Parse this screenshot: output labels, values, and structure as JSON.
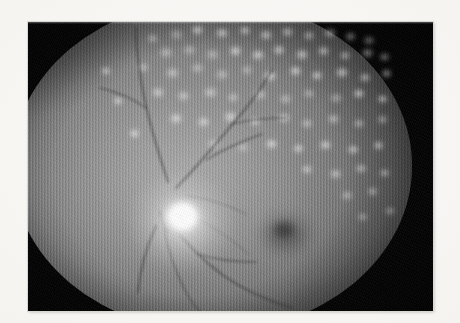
{
  "image": {
    "kind": "fundus-photograph",
    "modality": "Color fundus photography (reproduced grayscale)",
    "caption": "",
    "frame": {
      "background_color": "#050505",
      "page_color": "#f6f5f3"
    }
  },
  "figure": {
    "title": "",
    "label": "",
    "subtitle": ""
  },
  "anatomy": {
    "optic_disc": {
      "name": "optic disc",
      "center_x": 160,
      "center_y": 207,
      "brightness": "bright white"
    },
    "macula": {
      "name": "macula",
      "center_x": 257,
      "center_y": 212,
      "brightness": "dark"
    },
    "fovea": {
      "name": "fovea",
      "center_x": 256,
      "center_y": 208
    },
    "field_circle": {
      "name": "fundus field",
      "center_x": 184,
      "center_y": 144
    }
  },
  "findings": {
    "lesion_type": "panretinal laser photocoagulation scars",
    "lesion_color": "#ffffff",
    "distribution": "dense superiorly and temporally, sparse at macula"
  },
  "vessels": [
    {
      "id": "superotemporal-arcade",
      "d": "M176 188 C 196 168, 214 146, 236 120 C 250 104, 262 88, 272 70"
    },
    {
      "id": "superotemporal-branch-1",
      "d": "M206 160 C 222 150, 240 142, 262 134"
    },
    {
      "id": "superotemporal-branch-2",
      "d": "M232 124 C 248 120, 266 118, 286 118"
    },
    {
      "id": "superonasal-arcade",
      "d": "M168 182 C 158 152, 148 120, 142 86 C 138 62, 136 44, 136 28"
    },
    {
      "id": "superonasal-branch",
      "d": "M146 108 C 132 98, 118 92, 100 88"
    },
    {
      "id": "inferotemporal-arcade",
      "d": "M172 224 C 186 244, 202 260, 224 276 C 244 290, 266 300, 292 308"
    },
    {
      "id": "inferotemporal-branch-1",
      "d": "M164 228 C 168 252, 176 274, 188 296 C 194 306, 200 312, 206 318"
    },
    {
      "id": "inferotemporal-branch-2",
      "d": "M198 254 C 216 260, 234 262, 256 262"
    },
    {
      "id": "inferonasal-arcade",
      "d": "M156 226 C 146 248, 140 270, 138 292"
    },
    {
      "id": "disc-stem",
      "d": "M160 212 C 162 220, 164 226, 168 232"
    },
    {
      "id": "temporal-fine-1",
      "d": "M186 196 C 206 198, 226 204, 246 214"
    },
    {
      "id": "temporal-fine-2",
      "d": "M184 212 C 206 222, 228 236, 248 254"
    }
  ],
  "lesions": [
    {
      "x": 168,
      "y": 28,
      "w": 17,
      "h": 13
    },
    {
      "x": 190,
      "y": 24,
      "w": 15,
      "h": 12
    },
    {
      "x": 214,
      "y": 27,
      "w": 16,
      "h": 12
    },
    {
      "x": 238,
      "y": 25,
      "w": 14,
      "h": 11
    },
    {
      "x": 258,
      "y": 29,
      "w": 16,
      "h": 12
    },
    {
      "x": 280,
      "y": 26,
      "w": 15,
      "h": 12
    },
    {
      "x": 302,
      "y": 30,
      "w": 14,
      "h": 11
    },
    {
      "x": 322,
      "y": 27,
      "w": 16,
      "h": 12
    },
    {
      "x": 344,
      "y": 31,
      "w": 13,
      "h": 11
    },
    {
      "x": 146,
      "y": 33,
      "w": 13,
      "h": 11
    },
    {
      "x": 362,
      "y": 35,
      "w": 14,
      "h": 11
    },
    {
      "x": 158,
      "y": 46,
      "w": 16,
      "h": 13
    },
    {
      "x": 182,
      "y": 44,
      "w": 15,
      "h": 12
    },
    {
      "x": 204,
      "y": 48,
      "w": 17,
      "h": 13
    },
    {
      "x": 228,
      "y": 45,
      "w": 15,
      "h": 12
    },
    {
      "x": 250,
      "y": 49,
      "w": 16,
      "h": 12
    },
    {
      "x": 272,
      "y": 44,
      "w": 14,
      "h": 12
    },
    {
      "x": 294,
      "y": 48,
      "w": 16,
      "h": 13
    },
    {
      "x": 316,
      "y": 45,
      "w": 15,
      "h": 12
    },
    {
      "x": 338,
      "y": 50,
      "w": 14,
      "h": 11
    },
    {
      "x": 360,
      "y": 47,
      "w": 15,
      "h": 12
    },
    {
      "x": 378,
      "y": 52,
      "w": 13,
      "h": 10
    },
    {
      "x": 136,
      "y": 62,
      "w": 14,
      "h": 11
    },
    {
      "x": 164,
      "y": 66,
      "w": 17,
      "h": 14
    },
    {
      "x": 190,
      "y": 62,
      "w": 15,
      "h": 12
    },
    {
      "x": 214,
      "y": 68,
      "w": 16,
      "h": 13
    },
    {
      "x": 240,
      "y": 64,
      "w": 14,
      "h": 12
    },
    {
      "x": 262,
      "y": 70,
      "w": 16,
      "h": 12
    },
    {
      "x": 288,
      "y": 65,
      "w": 15,
      "h": 12
    },
    {
      "x": 310,
      "y": 70,
      "w": 14,
      "h": 11
    },
    {
      "x": 334,
      "y": 66,
      "w": 16,
      "h": 13
    },
    {
      "x": 358,
      "y": 72,
      "w": 14,
      "h": 11
    },
    {
      "x": 380,
      "y": 68,
      "w": 13,
      "h": 11
    },
    {
      "x": 150,
      "y": 86,
      "w": 16,
      "h": 13
    },
    {
      "x": 176,
      "y": 90,
      "w": 15,
      "h": 12
    },
    {
      "x": 202,
      "y": 86,
      "w": 17,
      "h": 13
    },
    {
      "x": 226,
      "y": 92,
      "w": 14,
      "h": 11
    },
    {
      "x": 252,
      "y": 88,
      "w": 16,
      "h": 13
    },
    {
      "x": 278,
      "y": 93,
      "w": 15,
      "h": 12
    },
    {
      "x": 302,
      "y": 88,
      "w": 14,
      "h": 11
    },
    {
      "x": 328,
      "y": 92,
      "w": 16,
      "h": 12
    },
    {
      "x": 352,
      "y": 88,
      "w": 14,
      "h": 11
    },
    {
      "x": 376,
      "y": 94,
      "w": 13,
      "h": 10
    },
    {
      "x": 168,
      "y": 112,
      "w": 16,
      "h": 13
    },
    {
      "x": 196,
      "y": 116,
      "w": 15,
      "h": 12
    },
    {
      "x": 222,
      "y": 110,
      "w": 17,
      "h": 14
    },
    {
      "x": 248,
      "y": 116,
      "w": 14,
      "h": 11
    },
    {
      "x": 276,
      "y": 112,
      "w": 16,
      "h": 12
    },
    {
      "x": 300,
      "y": 118,
      "w": 14,
      "h": 11
    },
    {
      "x": 326,
      "y": 113,
      "w": 15,
      "h": 12
    },
    {
      "x": 352,
      "y": 118,
      "w": 14,
      "h": 11
    },
    {
      "x": 376,
      "y": 114,
      "w": 13,
      "h": 11
    },
    {
      "x": 206,
      "y": 138,
      "w": 15,
      "h": 12
    },
    {
      "x": 236,
      "y": 142,
      "w": 14,
      "h": 11
    },
    {
      "x": 264,
      "y": 138,
      "w": 15,
      "h": 12
    },
    {
      "x": 292,
      "y": 143,
      "w": 13,
      "h": 11
    },
    {
      "x": 318,
      "y": 139,
      "w": 15,
      "h": 12
    },
    {
      "x": 346,
      "y": 144,
      "w": 14,
      "h": 11
    },
    {
      "x": 372,
      "y": 140,
      "w": 13,
      "h": 11
    },
    {
      "x": 300,
      "y": 164,
      "w": 14,
      "h": 11
    },
    {
      "x": 328,
      "y": 168,
      "w": 15,
      "h": 12
    },
    {
      "x": 354,
      "y": 163,
      "w": 14,
      "h": 11
    },
    {
      "x": 378,
      "y": 168,
      "w": 13,
      "h": 10
    },
    {
      "x": 340,
      "y": 190,
      "w": 14,
      "h": 11
    },
    {
      "x": 366,
      "y": 186,
      "w": 13,
      "h": 11
    },
    {
      "x": 384,
      "y": 206,
      "w": 12,
      "h": 10
    },
    {
      "x": 356,
      "y": 212,
      "w": 13,
      "h": 10
    },
    {
      "x": 128,
      "y": 128,
      "w": 13,
      "h": 11
    },
    {
      "x": 112,
      "y": 96,
      "w": 12,
      "h": 10
    },
    {
      "x": 100,
      "y": 66,
      "w": 12,
      "h": 10
    }
  ]
}
